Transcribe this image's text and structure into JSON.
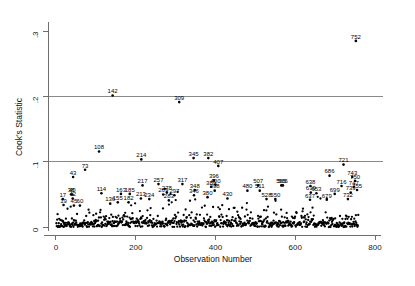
{
  "chart_data": {
    "type": "scatter",
    "title": "",
    "xlabel": "Observation Number",
    "ylabel": "Cook's Statistic",
    "xlim": [
      -20,
      815
    ],
    "ylim": [
      -0.006,
      0.315
    ],
    "xticks": [
      "0",
      "200",
      "400",
      "600",
      "800"
    ],
    "xtickvals": [
      0,
      200,
      400,
      600,
      800
    ],
    "yticks": [
      "0",
      ".1",
      ".2",
      ".3"
    ],
    "ytickvals": [
      0,
      0.1,
      0.2,
      0.3
    ],
    "grid": false,
    "legend": null,
    "reference_lines": [
      {
        "y": 0.1,
        "color": "#8a8a8a"
      },
      {
        "y": 0.2,
        "color": "#8a8a8a"
      }
    ],
    "labeled_points": [
      {
        "label": "752",
        "x": 752,
        "y": 0.286
      },
      {
        "label": "142",
        "x": 142,
        "y": 0.202
      },
      {
        "label": "309",
        "x": 309,
        "y": 0.192
      },
      {
        "label": "108",
        "x": 108,
        "y": 0.116
      },
      {
        "label": "214",
        "x": 214,
        "y": 0.104
      },
      {
        "label": "345",
        "x": 345,
        "y": 0.106
      },
      {
        "label": "382",
        "x": 382,
        "y": 0.106
      },
      {
        "label": "407",
        "x": 407,
        "y": 0.094
      },
      {
        "label": "721",
        "x": 721,
        "y": 0.096
      },
      {
        "label": "73",
        "x": 73,
        "y": 0.088
      },
      {
        "label": "43",
        "x": 43,
        "y": 0.077
      },
      {
        "label": "686",
        "x": 686,
        "y": 0.079
      },
      {
        "label": "743",
        "x": 743,
        "y": 0.077
      },
      {
        "label": "750",
        "x": 750,
        "y": 0.071
      },
      {
        "label": "396",
        "x": 396,
        "y": 0.072
      },
      {
        "label": "217",
        "x": 217,
        "y": 0.064
      },
      {
        "label": "257",
        "x": 257,
        "y": 0.066
      },
      {
        "label": "317",
        "x": 317,
        "y": 0.066
      },
      {
        "label": "400",
        "x": 400,
        "y": 0.065
      },
      {
        "label": "389",
        "x": 389,
        "y": 0.062
      },
      {
        "label": "507",
        "x": 507,
        "y": 0.064
      },
      {
        "label": "565",
        "x": 565,
        "y": 0.064
      },
      {
        "label": "566",
        "x": 569,
        "y": 0.064
      },
      {
        "label": "638",
        "x": 638,
        "y": 0.063
      },
      {
        "label": "716",
        "x": 716,
        "y": 0.063
      },
      {
        "label": "747",
        "x": 747,
        "y": 0.062
      },
      {
        "label": "755",
        "x": 755,
        "y": 0.057
      },
      {
        "label": "348",
        "x": 348,
        "y": 0.057
      },
      {
        "label": "398",
        "x": 398,
        "y": 0.056
      },
      {
        "label": "480",
        "x": 480,
        "y": 0.056
      },
      {
        "label": "511",
        "x": 511,
        "y": 0.056
      },
      {
        "label": "739",
        "x": 739,
        "y": 0.053
      },
      {
        "label": "639",
        "x": 639,
        "y": 0.053
      },
      {
        "label": "653",
        "x": 653,
        "y": 0.052
      },
      {
        "label": "699",
        "x": 699,
        "y": 0.051
      },
      {
        "label": "114",
        "x": 114,
        "y": 0.052
      },
      {
        "label": "163",
        "x": 163,
        "y": 0.051
      },
      {
        "label": "185",
        "x": 185,
        "y": 0.051
      },
      {
        "label": "278",
        "x": 278,
        "y": 0.053
      },
      {
        "label": "269",
        "x": 269,
        "y": 0.05
      },
      {
        "label": "297",
        "x": 297,
        "y": 0.049
      },
      {
        "label": "346",
        "x": 346,
        "y": 0.049
      },
      {
        "label": "38",
        "x": 38,
        "y": 0.05
      },
      {
        "label": "40",
        "x": 41,
        "y": 0.05
      },
      {
        "label": "42",
        "x": 42,
        "y": 0.044
      },
      {
        "label": "17",
        "x": 17,
        "y": 0.043
      },
      {
        "label": "380",
        "x": 380,
        "y": 0.046
      },
      {
        "label": "430",
        "x": 430,
        "y": 0.044
      },
      {
        "label": "528",
        "x": 528,
        "y": 0.043
      },
      {
        "label": "550",
        "x": 550,
        "y": 0.043
      },
      {
        "label": "637",
        "x": 637,
        "y": 0.042
      },
      {
        "label": "679",
        "x": 679,
        "y": 0.042
      },
      {
        "label": "732",
        "x": 732,
        "y": 0.043
      },
      {
        "label": "213",
        "x": 213,
        "y": 0.044
      },
      {
        "label": "234",
        "x": 234,
        "y": 0.043
      },
      {
        "label": "283",
        "x": 283,
        "y": 0.041
      },
      {
        "label": "155",
        "x": 155,
        "y": 0.038
      },
      {
        "label": "182",
        "x": 182,
        "y": 0.038
      },
      {
        "label": "136",
        "x": 136,
        "y": 0.036
      },
      {
        "label": "19",
        "x": 19,
        "y": 0.034
      },
      {
        "label": "45",
        "x": 45,
        "y": 0.033
      },
      {
        "label": "60",
        "x": 60,
        "y": 0.033
      }
    ],
    "point_count": 760,
    "note": "Dense band of Cook's D values near zero across observations 1-760"
  },
  "figure": {
    "background": "#ffffff",
    "page_background": "#fbfbfb",
    "axis_color": "#6e6e6e",
    "point_color": "#000000",
    "reference_line_color": "#8a8a8a"
  }
}
